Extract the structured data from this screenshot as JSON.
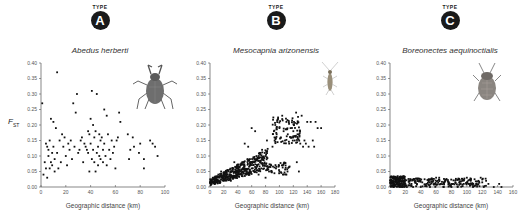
{
  "ylabel": {
    "main": "F",
    "sub": "ST"
  },
  "panels": [
    {
      "type_label": "TYPE",
      "letter": "A",
      "species": "Abedus herberti",
      "xlabel": "Geographic distance (km)",
      "insect_icon": "giant-water-bug-icon"
    },
    {
      "type_label": "TYPE",
      "letter": "B",
      "species": "Mesocapnia arizonensis",
      "xlabel": "Geographic distance (km)",
      "insect_icon": "stonefly-icon"
    },
    {
      "type_label": "TYPE",
      "letter": "C",
      "species": "Boreonectes aequinoctialis",
      "xlabel": "Geographic distance (km)",
      "insect_icon": "diving-beetle-icon"
    }
  ],
  "credit": "",
  "chart_data": [
    {
      "type": "scatter",
      "title": "Abedus herberti",
      "xlabel": "Geographic distance (km)",
      "ylabel": "F_ST",
      "xlim": [
        0,
        100
      ],
      "ylim": [
        0,
        0.4
      ],
      "xticks": [
        0,
        20,
        40,
        60,
        80,
        100
      ],
      "yticks": [
        0.0,
        0.05,
        0.1,
        0.15,
        0.2,
        0.25,
        0.3,
        0.35,
        0.4
      ],
      "grid": false,
      "trend": "no relationship; widely scattered 0.03-0.37",
      "points": [
        [
          1,
          0.27
        ],
        [
          2,
          0.04
        ],
        [
          3,
          0.08
        ],
        [
          4,
          0.06
        ],
        [
          4,
          0.14
        ],
        [
          5,
          0.13
        ],
        [
          5,
          0.03
        ],
        [
          6,
          0.12
        ],
        [
          6,
          0.1
        ],
        [
          7,
          0.15
        ],
        [
          7,
          0.06
        ],
        [
          8,
          0.22
        ],
        [
          8,
          0.08
        ],
        [
          9,
          0.11
        ],
        [
          9,
          0.07
        ],
        [
          10,
          0.21
        ],
        [
          10,
          0.13
        ],
        [
          11,
          0.09
        ],
        [
          11,
          0.05
        ],
        [
          12,
          0.19
        ],
        [
          13,
          0.37
        ],
        [
          13,
          0.11
        ],
        [
          14,
          0.06
        ],
        [
          15,
          0.15
        ],
        [
          16,
          0.08
        ],
        [
          17,
          0.17
        ],
        [
          18,
          0.13
        ],
        [
          19,
          0.16
        ],
        [
          20,
          0.1
        ],
        [
          21,
          0.07
        ],
        [
          22,
          0.14
        ],
        [
          23,
          0.12
        ],
        [
          24,
          0.15
        ],
        [
          25,
          0.09
        ],
        [
          26,
          0.27
        ],
        [
          27,
          0.13
        ],
        [
          28,
          0.24
        ],
        [
          29,
          0.3
        ],
        [
          30,
          0.11
        ],
        [
          31,
          0.12
        ],
        [
          32,
          0.15
        ],
        [
          33,
          0.16
        ],
        [
          34,
          0.08
        ],
        [
          35,
          0.14
        ],
        [
          36,
          0.13
        ],
        [
          37,
          0.12
        ],
        [
          38,
          0.11
        ],
        [
          38,
          0.18
        ],
        [
          39,
          0.17
        ],
        [
          39,
          0.05
        ],
        [
          40,
          0.22
        ],
        [
          40,
          0.14
        ],
        [
          41,
          0.31
        ],
        [
          41,
          0.09
        ],
        [
          42,
          0.2
        ],
        [
          42,
          0.12
        ],
        [
          43,
          0.16
        ],
        [
          43,
          0.08
        ],
        [
          44,
          0.18
        ],
        [
          44,
          0.05
        ],
        [
          45,
          0.3
        ],
        [
          45,
          0.11
        ],
        [
          46,
          0.13
        ],
        [
          46,
          0.07
        ],
        [
          47,
          0.17
        ],
        [
          47,
          0.1
        ],
        [
          48,
          0.15
        ],
        [
          48,
          0.09
        ],
        [
          49,
          0.16
        ],
        [
          50,
          0.12
        ],
        [
          50,
          0.08
        ],
        [
          51,
          0.25
        ],
        [
          51,
          0.14
        ],
        [
          52,
          0.1
        ],
        [
          53,
          0.23
        ],
        [
          53,
          0.07
        ],
        [
          54,
          0.17
        ],
        [
          55,
          0.12
        ],
        [
          56,
          0.09
        ],
        [
          57,
          0.15
        ],
        [
          58,
          0.11
        ],
        [
          59,
          0.13
        ],
        [
          60,
          0.06
        ],
        [
          61,
          0.15
        ],
        [
          62,
          0.16
        ],
        [
          63,
          0.24
        ],
        [
          64,
          0.21
        ],
        [
          70,
          0.17
        ],
        [
          71,
          0.09
        ],
        [
          72,
          0.12
        ],
        [
          74,
          0.16
        ],
        [
          75,
          0.13
        ],
        [
          79,
          0.11
        ],
        [
          80,
          0.14
        ],
        [
          83,
          0.09
        ],
        [
          83,
          0.06
        ],
        [
          88,
          0.15
        ],
        [
          90,
          0.14
        ],
        [
          92,
          0.13
        ],
        [
          94,
          0.1
        ]
      ]
    },
    {
      "type": "scatter",
      "title": "Mesocapnia arizonensis",
      "xlabel": "Geographic distance (km)",
      "ylabel": "F_ST",
      "xlim": [
        0,
        180
      ],
      "ylim": [
        0,
        0.4
      ],
      "xticks": [
        0,
        20,
        40,
        60,
        80,
        100,
        120,
        140,
        160,
        180
      ],
      "yticks": [
        0.0,
        0.05,
        0.1,
        0.15,
        0.2,
        0.25,
        0.3,
        0.35,
        0.4
      ],
      "grid": false,
      "trend": "positive relationship (isolation by distance); dense cluster 0-85 km rising 0.01-0.10, upper cluster 90-160 km at 0.13-0.24",
      "points": [
        [
          2,
          0.02
        ],
        [
          4,
          0.03
        ],
        [
          6,
          0.02
        ],
        [
          8,
          0.03
        ],
        [
          10,
          0.02
        ],
        [
          12,
          0.04
        ],
        [
          14,
          0.03
        ],
        [
          16,
          0.05
        ],
        [
          18,
          0.03
        ],
        [
          20,
          0.02
        ],
        [
          22,
          0.04
        ],
        [
          25,
          0.03
        ],
        [
          28,
          0.04
        ],
        [
          30,
          0.02
        ],
        [
          33,
          0.05
        ],
        [
          35,
          0.08
        ],
        [
          38,
          0.04
        ],
        [
          40,
          0.06
        ],
        [
          42,
          0.05
        ],
        [
          44,
          0.07
        ],
        [
          46,
          0.04
        ],
        [
          48,
          0.08
        ],
        [
          50,
          0.06
        ],
        [
          50,
          0.14
        ],
        [
          52,
          0.05
        ],
        [
          54,
          0.09
        ],
        [
          55,
          0.13
        ],
        [
          56,
          0.04
        ],
        [
          58,
          0.07
        ],
        [
          60,
          0.06
        ],
        [
          60,
          0.19
        ],
        [
          62,
          0.08
        ],
        [
          64,
          0.05
        ],
        [
          65,
          0.18
        ],
        [
          66,
          0.09
        ],
        [
          68,
          0.07
        ],
        [
          70,
          0.1
        ],
        [
          70,
          0.04
        ],
        [
          72,
          0.08
        ],
        [
          74,
          0.06
        ],
        [
          75,
          0.12
        ],
        [
          76,
          0.09
        ],
        [
          78,
          0.07
        ],
        [
          80,
          0.1
        ],
        [
          80,
          0.03
        ],
        [
          82,
          0.15
        ],
        [
          85,
          0.05
        ],
        [
          88,
          0.07
        ],
        [
          90,
          0.13
        ],
        [
          92,
          0.18
        ],
        [
          94,
          0.2
        ],
        [
          95,
          0.06
        ],
        [
          96,
          0.17
        ],
        [
          98,
          0.22
        ],
        [
          100,
          0.19
        ],
        [
          100,
          0.05
        ],
        [
          102,
          0.16
        ],
        [
          104,
          0.23
        ],
        [
          105,
          0.07
        ],
        [
          106,
          0.18
        ],
        [
          108,
          0.15
        ],
        [
          110,
          0.21
        ],
        [
          110,
          0.04
        ],
        [
          112,
          0.17
        ],
        [
          114,
          0.14
        ],
        [
          116,
          0.19
        ],
        [
          118,
          0.16
        ],
        [
          120,
          0.18
        ],
        [
          122,
          0.15
        ],
        [
          124,
          0.24
        ],
        [
          125,
          0.08
        ],
        [
          126,
          0.17
        ],
        [
          128,
          0.05
        ],
        [
          130,
          0.14
        ],
        [
          132,
          0.23
        ],
        [
          134,
          0.13
        ],
        [
          136,
          0.15
        ],
        [
          138,
          0.14
        ],
        [
          140,
          0.21
        ],
        [
          142,
          0.13
        ],
        [
          145,
          0.21
        ],
        [
          148,
          0.15
        ],
        [
          150,
          0.13
        ],
        [
          152,
          0.21
        ],
        [
          155,
          0.19
        ],
        [
          160,
          0.19
        ]
      ]
    },
    {
      "type": "scatter",
      "title": "Boreonectes aequinoctialis",
      "xlabel": "Geographic distance (km)",
      "ylabel": "F_ST",
      "xlim": [
        0,
        160
      ],
      "ylim": [
        0,
        0.4
      ],
      "xticks": [
        0,
        20,
        40,
        60,
        80,
        100,
        120,
        140,
        160
      ],
      "yticks": [
        0.0,
        0.05,
        0.1,
        0.15,
        0.2,
        0.25,
        0.3,
        0.35,
        0.4
      ],
      "grid": false,
      "trend": "near-zero differentiation at all distances (0.00-0.035)",
      "points": [
        [
          1,
          0.01
        ],
        [
          3,
          0.02
        ],
        [
          5,
          0.0
        ],
        [
          7,
          0.03
        ],
        [
          9,
          0.01
        ],
        [
          10,
          0.035
        ],
        [
          11,
          0.02
        ],
        [
          13,
          0.01
        ],
        [
          14,
          0.03
        ],
        [
          16,
          0.0
        ],
        [
          18,
          0.02
        ],
        [
          20,
          0.01
        ],
        [
          22,
          0.0
        ],
        [
          25,
          0.02
        ],
        [
          28,
          0.01
        ],
        [
          30,
          0.0
        ],
        [
          32,
          0.025
        ],
        [
          35,
          0.01
        ],
        [
          38,
          0.02
        ],
        [
          40,
          0.0
        ],
        [
          42,
          0.015
        ],
        [
          45,
          0.025
        ],
        [
          48,
          0.01
        ],
        [
          50,
          0.02
        ],
        [
          52,
          0.0
        ],
        [
          55,
          0.025
        ],
        [
          58,
          0.01
        ],
        [
          60,
          0.03
        ],
        [
          62,
          0.02
        ],
        [
          64,
          0.03
        ],
        [
          66,
          0.01
        ],
        [
          70,
          0.0
        ],
        [
          72,
          0.02
        ],
        [
          76,
          0.01
        ],
        [
          80,
          0.0
        ],
        [
          82,
          0.01
        ],
        [
          85,
          0.02
        ],
        [
          88,
          0.0
        ],
        [
          90,
          0.015
        ],
        [
          94,
          0.02
        ],
        [
          96,
          0.01
        ],
        [
          100,
          0.03
        ],
        [
          102,
          0.01
        ],
        [
          105,
          0.02
        ],
        [
          108,
          0.0
        ],
        [
          110,
          0.025
        ],
        [
          112,
          0.01
        ],
        [
          115,
          0.02
        ],
        [
          118,
          0.03
        ],
        [
          120,
          0.015
        ],
        [
          122,
          0.0
        ],
        [
          125,
          0.02
        ],
        [
          128,
          0.01
        ],
        [
          135,
          0.0
        ],
        [
          142,
          0.01
        ],
        [
          145,
          0.0
        ]
      ]
    }
  ]
}
